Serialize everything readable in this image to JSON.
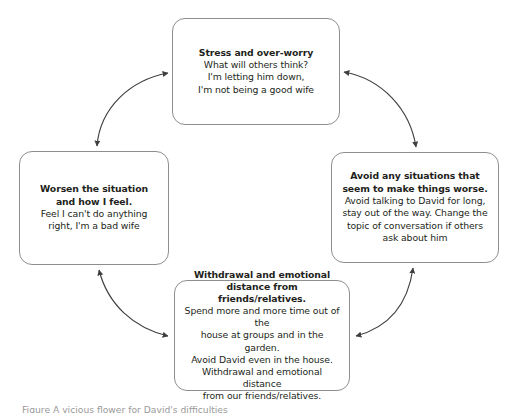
{
  "figure": {
    "type": "vicious-cycle-diagram",
    "caption": "Figure   A vicious flower for David's difficulties",
    "caption_clipped": true,
    "colors": {
      "box_border": "#8e8e8e",
      "box_fill": "#ffffff",
      "text": "#231f20",
      "arrow": "#3f3f3f",
      "caption_text": "#9a9a9a"
    }
  },
  "nodes": [
    {
      "id": "stress",
      "heading": "Stress and over-worry",
      "body": "What will others think?\nI'm letting him down,\nI'm not being a good wife"
    },
    {
      "id": "avoidance",
      "heading": "Avoid any situations that\nseem to make things worse.",
      "body": "Avoid talking to David for long,\nstay out of the way. Change the\ntopic of conversation if others\nask about him"
    },
    {
      "id": "withdrawal",
      "heading": "Withdrawal and emotional\ndistance from friends/relatives.",
      "body": "Spend more and more time out of the\nhouse at groups and in the garden.\nAvoid David even in the house.\nWithdrawal and emotional distance\nfrom our friends/relatives."
    },
    {
      "id": "worsening",
      "heading": "Worsen the situation\nand how I feel.",
      "body": "Feel I can't do anything\nright, I'm a bad wife"
    }
  ],
  "connectors": [
    {
      "id": "worsening-to-stress",
      "from": "worsening",
      "to": "stress",
      "style": "curved",
      "heads": "double"
    },
    {
      "id": "stress-to-avoidance",
      "from": "stress",
      "to": "avoidance",
      "style": "curved",
      "heads": "double"
    },
    {
      "id": "avoidance-to-withdrawal",
      "from": "avoidance",
      "to": "withdrawal",
      "style": "curved",
      "heads": "double"
    },
    {
      "id": "withdrawal-to-worsening",
      "from": "withdrawal",
      "to": "worsening",
      "style": "curved",
      "heads": "double"
    }
  ]
}
